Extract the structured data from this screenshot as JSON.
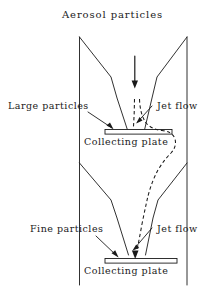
{
  "figure": {
    "type": "schematic-diagram",
    "background_color": "#ffffff",
    "line_color": "#1a1a1a"
  },
  "labels": {
    "title": "Aerosol  particles",
    "large_particles": "Large  particles",
    "jet_flow_upper": "Jet  flow",
    "collecting_plate_upper": "Collecting  plate",
    "fine_particles": "Fine  particles",
    "jet_flow_lower": "Jet  flow",
    "collecting_plate_lower": "Collecting  plate"
  },
  "elements": {
    "inlet_arrow": "down-arrow-icon",
    "upper_plate": "collecting-plate-bar",
    "lower_plate": "collecting-plate-bar",
    "jet_flow_path": "dashed-streamline",
    "housing_wall_left": "vertical-wall",
    "housing_wall_right": "vertical-wall",
    "upper_nozzle": "converging-funnel",
    "lower_nozzle": "converging-funnel"
  }
}
